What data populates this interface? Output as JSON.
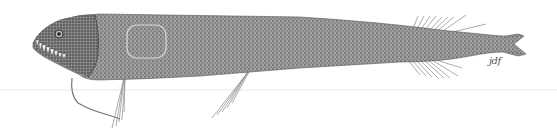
{
  "illustration": {
    "subject": "deep-sea dragonfish, lateral view",
    "style": "stippled scientific illustration",
    "signature": "jdf",
    "colors": {
      "background": "#ffffff",
      "body_fill": "#8a8a8a",
      "body_dark": "#555555",
      "teeth": "#ffffff",
      "photophore_outline": "#d0d0d0"
    }
  }
}
